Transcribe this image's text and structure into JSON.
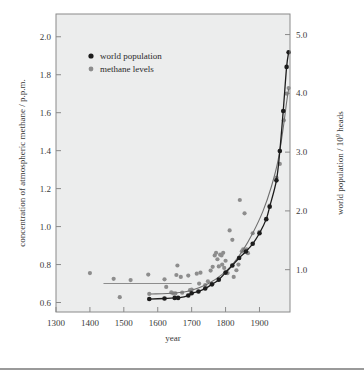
{
  "chart_data": {
    "type": "scatter",
    "title": "",
    "xlabel": "year",
    "ylabel": "concentration of atmospheric methane / p.p.m.",
    "y2label": "world population / 10⁹ heads",
    "xlim": [
      1300,
      1990
    ],
    "ylim": [
      0.55,
      2.12
    ],
    "y2lim": [
      0.28,
      5.35
    ],
    "grid": false,
    "legend_position": "upper-left-inside",
    "xticks": [
      1300,
      1400,
      1500,
      1600,
      1700,
      1800,
      1900
    ],
    "xticklabels": [
      "1300",
      "1400",
      "1500",
      "1600",
      "1700",
      "1800",
      "1900"
    ],
    "yticks": [
      0.6,
      0.8,
      1.0,
      1.2,
      1.4,
      1.6,
      1.8,
      2.0
    ],
    "yticklabels": [
      "0.6",
      "0.8",
      "1.0",
      "1.2",
      "1.4",
      "1.6",
      "1.8",
      "2.0"
    ],
    "y2ticks": [
      1.0,
      2.0,
      3.0,
      4.0,
      5.0
    ],
    "y2ticklabels": [
      "1.0",
      "2.0",
      "3.0",
      "4.0",
      "5.0"
    ],
    "series": [
      {
        "name": "methane levels",
        "marker": "dot",
        "color": "#8d8d8d",
        "axis": "left",
        "points": [
          [
            1400,
            0.755
          ],
          [
            1470,
            0.725
          ],
          [
            1488,
            0.628
          ],
          [
            1520,
            0.718
          ],
          [
            1572,
            0.747
          ],
          [
            1575,
            0.645
          ],
          [
            1620,
            0.722
          ],
          [
            1625,
            0.682
          ],
          [
            1640,
            0.653
          ],
          [
            1646,
            0.648
          ],
          [
            1652,
            0.648
          ],
          [
            1655,
            0.745
          ],
          [
            1658,
            0.795
          ],
          [
            1668,
            0.735
          ],
          [
            1672,
            0.652
          ],
          [
            1690,
            0.742
          ],
          [
            1695,
            0.665
          ],
          [
            1700,
            0.668
          ],
          [
            1715,
            0.752
          ],
          [
            1722,
            0.7
          ],
          [
            1726,
            0.757
          ],
          [
            1740,
            0.692
          ],
          [
            1748,
            0.712
          ],
          [
            1756,
            0.768
          ],
          [
            1762,
            0.788
          ],
          [
            1768,
            0.848
          ],
          [
            1772,
            0.862
          ],
          [
            1776,
            0.828
          ],
          [
            1780,
            0.79
          ],
          [
            1784,
            0.852
          ],
          [
            1788,
            0.848
          ],
          [
            1790,
            0.8
          ],
          [
            1793,
            0.862
          ],
          [
            1796,
            0.782
          ],
          [
            1800,
            0.82
          ],
          [
            1806,
            0.755
          ],
          [
            1812,
            0.98
          ],
          [
            1820,
            0.93
          ],
          [
            1824,
            0.735
          ],
          [
            1832,
            0.77
          ],
          [
            1838,
            0.8
          ],
          [
            1842,
            1.14
          ],
          [
            1848,
            0.87
          ],
          [
            1852,
            0.88
          ],
          [
            1856,
            1.07
          ],
          [
            1862,
            0.88
          ],
          [
            1866,
            0.86
          ],
          [
            1880,
            0.965
          ],
          [
            1900,
            0.972
          ],
          [
            1930,
            1.11
          ],
          [
            1950,
            1.258
          ],
          [
            1960,
            1.33
          ],
          [
            1972,
            1.56
          ],
          [
            1980,
            1.7
          ],
          [
            1986,
            1.73
          ]
        ]
      },
      {
        "name": "world population",
        "marker": "dot",
        "color": "#1c1c1c",
        "axis": "right",
        "points": [
          [
            1575,
            0.5
          ],
          [
            1620,
            0.51
          ],
          [
            1650,
            0.52
          ],
          [
            1660,
            0.52
          ],
          [
            1690,
            0.56
          ],
          [
            1700,
            0.6
          ],
          [
            1720,
            0.63
          ],
          [
            1740,
            0.68
          ],
          [
            1760,
            0.75
          ],
          [
            1780,
            0.83
          ],
          [
            1800,
            0.95
          ],
          [
            1820,
            1.07
          ],
          [
            1840,
            1.2
          ],
          [
            1860,
            1.31
          ],
          [
            1880,
            1.44
          ],
          [
            1900,
            1.62
          ],
          [
            1920,
            1.86
          ],
          [
            1930,
            2.07
          ],
          [
            1950,
            2.52
          ],
          [
            1960,
            3.02
          ],
          [
            1970,
            3.7
          ],
          [
            1980,
            4.45
          ],
          [
            1986,
            4.7
          ]
        ]
      }
    ],
    "annotations": [
      {
        "type": "reference-line",
        "label": "pre-industrial methane baseline",
        "value": 0.7,
        "x_start": 1440,
        "x_end": 1700
      }
    ]
  },
  "legend": {
    "entries": [
      {
        "label": "world population",
        "color": "#1c1c1c"
      },
      {
        "label": "methane  levels",
        "color": "#8d8d8d"
      }
    ]
  },
  "axes": {
    "x_title": "year",
    "y_left_title": "concentration of atmospheric methane / p.p.m.",
    "y_right_title_main": "world population / 10",
    "y_right_title_exp": "9",
    "y_right_title_tail": " heads"
  }
}
